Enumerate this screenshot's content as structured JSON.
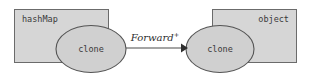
{
  "diagram": {
    "type": "object-graph",
    "background_color": "#ffffff",
    "box_fill_color": "#d6d6d6",
    "box_stroke_color": "#6b6b6b",
    "ellipse_fill_color": "#d0d0d0",
    "ellipse_stroke_color": "#545454",
    "edge_color": "#4a4a4a",
    "nodes": [
      {
        "id": "hashmap-container",
        "box_label": "hashMap",
        "box_label_align": "left",
        "inner_label": "clone"
      },
      {
        "id": "object-container",
        "box_label": "object",
        "box_label_align": "right",
        "inner_label": "clone"
      }
    ],
    "edges": [
      {
        "id": "forward-edge",
        "label": "Forward",
        "label_superscript": "+",
        "from": "hashmap-container",
        "to": "object-container",
        "arrowhead": "filled-triangle"
      }
    ]
  }
}
